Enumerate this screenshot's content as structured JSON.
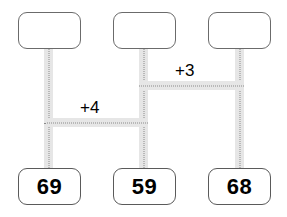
{
  "diagram": {
    "type": "number-bond-difference-diagram",
    "top_nodes": [
      {
        "id": "top-left",
        "value": ""
      },
      {
        "id": "top-middle",
        "value": ""
      },
      {
        "id": "top-right",
        "value": ""
      }
    ],
    "bottom_nodes": [
      {
        "id": "bottom-left",
        "value": "69"
      },
      {
        "id": "bottom-middle",
        "value": "59"
      },
      {
        "id": "bottom-right",
        "value": "68"
      }
    ],
    "edge_labels": [
      {
        "id": "edge-left-middle",
        "value": "+4"
      },
      {
        "id": "edge-middle-right",
        "value": "+3"
      }
    ],
    "colors": {
      "background": "#ffffff",
      "box_border": "#5a5a5a",
      "connector_band": "#e6e6e6",
      "connector_dots": "#8a8a8a",
      "text": "#000000"
    }
  }
}
